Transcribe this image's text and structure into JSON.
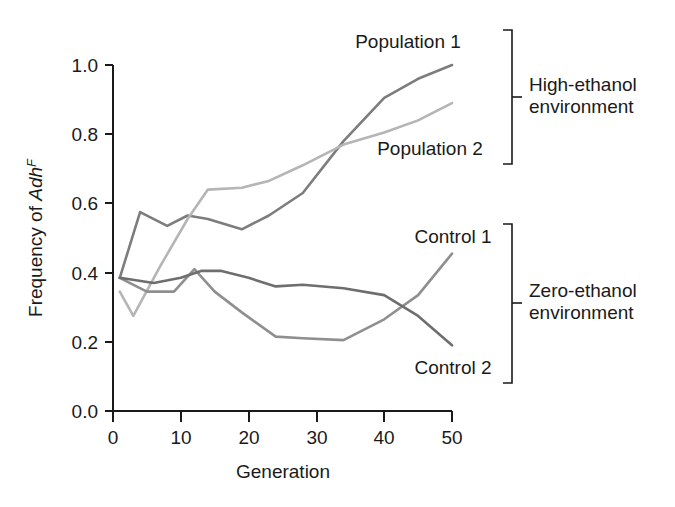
{
  "chart_data": {
    "type": "line",
    "title": "",
    "xlabel": "Generation",
    "ylabel": "Frequency of Adh",
    "ylabel_superscript": "F",
    "xlim": [
      0,
      50
    ],
    "ylim": [
      0.0,
      1.0
    ],
    "xticks": [
      0,
      10,
      20,
      30,
      40,
      50
    ],
    "xtick_labels": [
      "0",
      "10",
      "20",
      "30",
      "40",
      "50"
    ],
    "yticks": [
      0.0,
      0.2,
      0.4,
      0.6,
      0.8,
      1.0
    ],
    "ytick_labels": [
      "0.0",
      "0.2",
      "0.4",
      "0.6",
      "0.8",
      "1.0"
    ],
    "grid": false,
    "legend_position": "right-inline-labels",
    "series": [
      {
        "name": "Population 1",
        "color": "#7d7d7d",
        "group": "High-ethanol environment",
        "x": [
          1,
          4,
          8,
          11,
          14,
          19,
          23,
          28,
          34,
          40,
          45,
          50
        ],
        "y": [
          0.385,
          0.575,
          0.535,
          0.565,
          0.555,
          0.525,
          0.565,
          0.63,
          0.78,
          0.905,
          0.96,
          1.0
        ]
      },
      {
        "name": "Population 2",
        "color": "#b5b5b5",
        "group": "High-ethanol environment",
        "x": [
          1,
          3,
          7,
          11,
          14,
          19,
          23,
          28,
          34,
          40,
          45,
          50
        ],
        "y": [
          0.345,
          0.275,
          0.42,
          0.555,
          0.64,
          0.645,
          0.665,
          0.71,
          0.77,
          0.805,
          0.84,
          0.89
        ]
      },
      {
        "name": "Control 1",
        "color": "#8f8f8f",
        "group": "Zero-ethanol environment",
        "x": [
          1,
          5,
          9,
          12,
          15,
          19,
          24,
          28,
          34,
          40,
          45,
          50
        ],
        "y": [
          0.385,
          0.345,
          0.345,
          0.41,
          0.345,
          0.285,
          0.215,
          0.21,
          0.205,
          0.265,
          0.335,
          0.455
        ]
      },
      {
        "name": "Control 2",
        "color": "#6e6e6e",
        "group": "Zero-ethanol environment",
        "x": [
          1,
          6,
          10,
          13,
          16,
          20,
          24,
          28,
          34,
          40,
          45,
          50
        ],
        "y": [
          0.385,
          0.37,
          0.385,
          0.405,
          0.405,
          0.385,
          0.36,
          0.365,
          0.355,
          0.335,
          0.275,
          0.19
        ]
      }
    ],
    "annotations": [
      {
        "text": "Population 1",
        "for": "Population 1"
      },
      {
        "text": "Population 2",
        "for": "Population 2"
      },
      {
        "text": "Control 1",
        "for": "Control 1"
      },
      {
        "text": "Control 2",
        "for": "Control 2"
      }
    ],
    "groups": [
      {
        "label_line1": "High-ethanol",
        "label_line2": "environment"
      },
      {
        "label_line1": "Zero-ethanol",
        "label_line2": "environment"
      }
    ]
  },
  "axes": {
    "x_title": "Generation",
    "y_title_main": "Frequency of ",
    "y_title_italic": "Adh",
    "y_title_sup": "F"
  },
  "ticks": {
    "x": [
      "0",
      "10",
      "20",
      "30",
      "40",
      "50"
    ],
    "y": [
      "1.0",
      "0.8",
      "0.6",
      "0.4",
      "0.2",
      "0.0"
    ]
  },
  "labels": {
    "population1": "Population 1",
    "population2": "Population 2",
    "control1": "Control 1",
    "control2": "Control 2",
    "high_ethanol_l1": "High-ethanol",
    "high_ethanol_l2": "environment",
    "zero_ethanol_l1": "Zero-ethanol",
    "zero_ethanol_l2": "environment"
  },
  "colors": {
    "population1": "#7d7d7d",
    "population2": "#b5b5b5",
    "control1": "#8f8f8f",
    "control2": "#6e6e6e",
    "axis": "#1a1a1a"
  }
}
